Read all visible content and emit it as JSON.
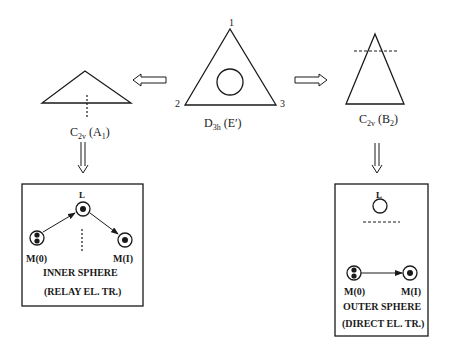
{
  "center": {
    "vertex_labels": [
      "1",
      "2",
      "3"
    ],
    "symmetry": "D",
    "symmetry_sub": "3h",
    "state": " (E′)"
  },
  "left": {
    "symmetry": "C",
    "symmetry_sub": "2v",
    "state_open": " (A",
    "state_sub": "1",
    "state_close": ")"
  },
  "right": {
    "symmetry": "C",
    "symmetry_sub": "2v",
    "state_open": " (B",
    "state_sub": "2",
    "state_close": ")"
  },
  "inner_box": {
    "ligand_label": "L",
    "donor_label": "M(0)",
    "acceptor_label": "M(I)",
    "title": "INNER SPHERE",
    "subtitle": "(RELAY EL. TR.)"
  },
  "outer_box": {
    "ligand_label": "L",
    "donor_label": "M(0)",
    "acceptor_label": "M(I)",
    "title": "OUTER SPHERE",
    "subtitle": "(DIRECT EL. TR.)"
  },
  "colors": {
    "line": "#1a1a1a",
    "background": "#ffffff"
  }
}
